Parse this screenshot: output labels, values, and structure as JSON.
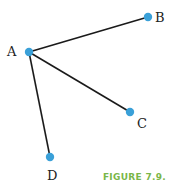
{
  "figure": {
    "caption": "FIGURE 7.9.",
    "caption_color": "#7ab648",
    "node_color": "#3aa0d8",
    "edge_color": "#1a1a1a"
  },
  "nodes": [
    {
      "id": "A",
      "label": "A",
      "x": 29,
      "y": 52,
      "lx": 12,
      "ly": 56
    },
    {
      "id": "B",
      "label": "B",
      "x": 148,
      "y": 17,
      "lx": 156,
      "ly": 22
    },
    {
      "id": "C",
      "label": "C",
      "x": 130,
      "y": 112,
      "lx": 137,
      "ly": 128
    },
    {
      "id": "D",
      "label": "D",
      "x": 50,
      "y": 157,
      "lx": 49,
      "ly": 180
    }
  ],
  "edges": [
    {
      "from": "A",
      "to": "B"
    },
    {
      "from": "A",
      "to": "C"
    },
    {
      "from": "A",
      "to": "D"
    }
  ]
}
